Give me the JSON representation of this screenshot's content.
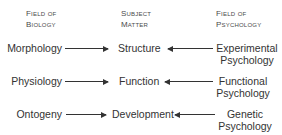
{
  "headers": {
    "biology": {
      "line1": "Field of",
      "line2": "Biology"
    },
    "subject": {
      "line1": "Subject",
      "line2": "Matter"
    },
    "psychology": {
      "line1": "Field of",
      "line2": "Psychology"
    }
  },
  "rows": [
    {
      "biology": "Morphology",
      "subject": "Structure",
      "psychology_line1": "Experimental",
      "psychology_line2": "Psychology"
    },
    {
      "biology": "Physiology",
      "subject": "Function",
      "psychology_line1": "Functional",
      "psychology_line2": "Psychology"
    },
    {
      "biology": "Ontogeny",
      "subject": "Development",
      "psychology_line1": "Genetic",
      "psychology_line2": "Psychology"
    }
  ],
  "arrows": [
    {
      "from": "Morphology",
      "to": "Structure"
    },
    {
      "from": "Experimental Psychology",
      "to": "Structure"
    },
    {
      "from": "Physiology",
      "to": "Function"
    },
    {
      "from": "Functional Psychology",
      "to": "Function"
    },
    {
      "from": "Ontogeny",
      "to": "Development"
    },
    {
      "from": "Genetic Psychology",
      "to": "Development"
    }
  ]
}
